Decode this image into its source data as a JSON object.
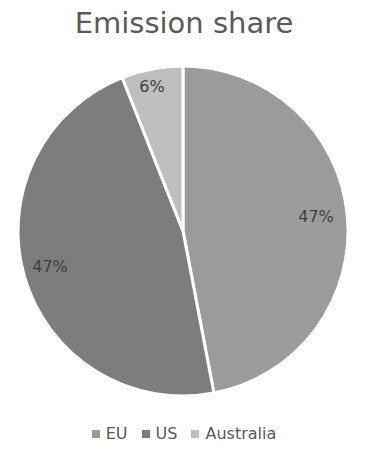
{
  "chart_data": {
    "type": "pie",
    "title": "Emission share",
    "categories": [
      "EU",
      "US",
      "Australia"
    ],
    "values": [
      47,
      47,
      6
    ],
    "labels": [
      "47%",
      "47%",
      "6%"
    ],
    "colors": [
      "#9b9b9b",
      "#7d7d7d",
      "#bebebe"
    ],
    "start_angle_deg": 0,
    "direction": "clockwise",
    "legend_position": "bottom"
  },
  "legend": {
    "items": [
      {
        "label": "EU",
        "color": "#9b9b9b"
      },
      {
        "label": "US",
        "color": "#7d7d7d"
      },
      {
        "label": "Australia",
        "color": "#bebebe"
      }
    ]
  }
}
